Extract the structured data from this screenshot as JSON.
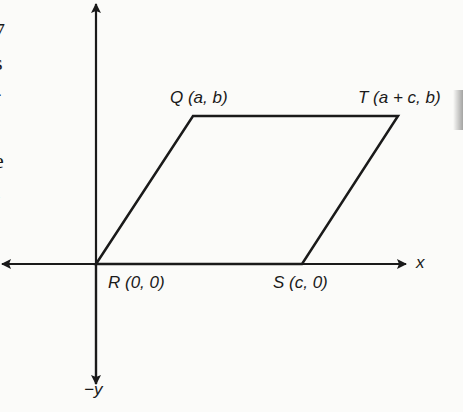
{
  "diagram": {
    "type": "coordinate-parallelogram",
    "axes": {
      "x_label": "x",
      "neg_y_label": "−y"
    },
    "points": [
      {
        "id": "Q",
        "label": "Q (a, b)",
        "x": 193,
        "y": 116
      },
      {
        "id": "T",
        "label": "T (a + c, b)",
        "x": 398,
        "y": 116
      },
      {
        "id": "R",
        "label": "R (0, 0)",
        "x": 96,
        "y": 264
      },
      {
        "id": "S",
        "label": "S (c, 0)",
        "x": 302,
        "y": 264
      }
    ],
    "left_margin_fragments": [
      "7",
      "s",
      "-",
      "e",
      "l"
    ],
    "colors": {
      "ink": "#1a1a1a",
      "paper": "#fbfbf9"
    }
  }
}
